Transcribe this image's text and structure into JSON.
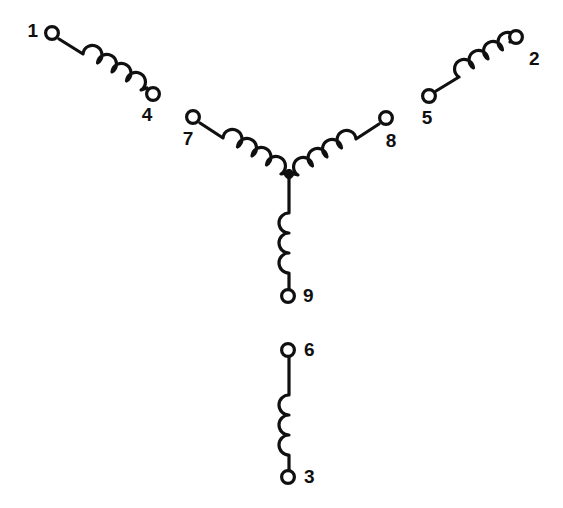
{
  "diagram": {
    "type": "motor-winding-schematic",
    "background_color": "#ffffff",
    "line_color": "#101010",
    "terminal_fill": "#ffffff",
    "canvas": {
      "width": 563,
      "height": 508
    },
    "labels": {
      "one": "1",
      "two": "2",
      "three": "3",
      "four": "4",
      "five": "5",
      "six": "6",
      "seven": "7",
      "eight": "8",
      "nine": "9"
    },
    "terminals": [
      {
        "id": "1",
        "label": "1",
        "x": 52,
        "y": 33,
        "label_x": 38,
        "label_y": 31,
        "anchor": "end"
      },
      {
        "id": "4",
        "label": "4",
        "x": 153,
        "y": 94,
        "label_x": 147,
        "label_y": 116,
        "anchor": "middle"
      },
      {
        "id": "2",
        "label": "2",
        "x": 516,
        "y": 37,
        "label_x": 529,
        "label_y": 60,
        "anchor": "start"
      },
      {
        "id": "5",
        "label": "5",
        "x": 429,
        "y": 96,
        "label_x": 427,
        "label_y": 119,
        "anchor": "middle"
      },
      {
        "id": "7",
        "label": "7",
        "x": 193,
        "y": 117,
        "label_x": 188,
        "label_y": 140,
        "anchor": "middle"
      },
      {
        "id": "8",
        "label": "8",
        "x": 386,
        "y": 118,
        "label_x": 391,
        "label_y": 142,
        "anchor": "middle"
      },
      {
        "id": "9",
        "label": "9",
        "x": 288,
        "y": 296,
        "label_x": 303,
        "label_y": 296,
        "anchor": "start"
      },
      {
        "id": "6",
        "label": "6",
        "x": 288,
        "y": 350,
        "label_x": 304,
        "label_y": 350,
        "anchor": "start"
      },
      {
        "id": "3",
        "label": "3",
        "x": 288,
        "y": 477,
        "label_x": 304,
        "label_y": 477,
        "anchor": "start"
      }
    ],
    "junction": {
      "x": 289,
      "y": 174,
      "radius": 4.5,
      "name": "wye-neutral-point"
    },
    "coils": [
      {
        "name": "coil-1-4",
        "from": "1",
        "to": "4",
        "humps": 4,
        "orientation": "diagonal-down-right"
      },
      {
        "name": "coil-2-5",
        "from": "5",
        "to": "2",
        "humps": 4,
        "orientation": "diagonal-up-right"
      },
      {
        "name": "coil-3-6",
        "from": "6",
        "to": "3",
        "humps": 3,
        "orientation": "vertical"
      },
      {
        "name": "coil-7-junction",
        "from": "7",
        "to": "junction",
        "humps": 4,
        "orientation": "diagonal-down-right"
      },
      {
        "name": "coil-8-junction",
        "from": "8",
        "to": "junction",
        "humps": 4,
        "orientation": "diagonal-down-left"
      },
      {
        "name": "coil-9-junction",
        "from": "junction",
        "to": "9",
        "humps": 3,
        "orientation": "vertical"
      }
    ],
    "groups": [
      {
        "name": "wye-group",
        "members": [
          "7",
          "8",
          "9"
        ],
        "connection": "wye"
      },
      {
        "name": "isolated-coils",
        "members": [
          "1-4",
          "2-5",
          "3-6"
        ],
        "connection": "open"
      }
    ]
  }
}
